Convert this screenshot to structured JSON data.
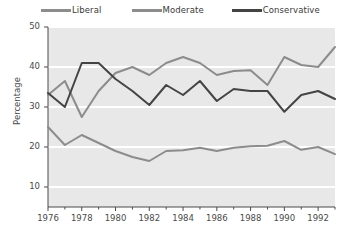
{
  "legend": {
    "position": "top",
    "items": [
      {
        "label": "Liberal",
        "color": "#8c8c8c"
      },
      {
        "label": "Moderate",
        "color": "#8c8c8c"
      },
      {
        "label": "Conservative",
        "color": "#444444"
      }
    ]
  },
  "axes": {
    "ylabel": "Percentage",
    "yticks": [
      "10",
      "20",
      "30",
      "40",
      "50"
    ],
    "xticks": [
      "1976",
      "1978",
      "1980",
      "1982",
      "1984",
      "1986",
      "1988",
      "1990",
      "1992"
    ]
  },
  "colors": {
    "plot_background": "#e8e8e8",
    "gridline": "#ffffff",
    "axis": "#4a4a4a",
    "tick_text": "#4a4a4a"
  },
  "chart_data": {
    "type": "line",
    "title": "",
    "xlabel": "",
    "ylabel": "Percentage",
    "xlim": [
      1976,
      1993
    ],
    "ylim": [
      5,
      50
    ],
    "grid": true,
    "x": [
      1976,
      1977,
      1978,
      1979,
      1980,
      1981,
      1982,
      1983,
      1984,
      1985,
      1986,
      1987,
      1988,
      1989,
      1990,
      1991,
      1992,
      1993
    ],
    "series": [
      {
        "name": "Liberal",
        "color": "#8c8c8c",
        "values": [
          25.0,
          20.5,
          23.0,
          21.0,
          19.0,
          17.5,
          16.5,
          19.0,
          19.2,
          19.8,
          19.0,
          19.8,
          20.2,
          20.3,
          21.5,
          19.3,
          20.0,
          18.2
        ]
      },
      {
        "name": "Moderate",
        "color": "#8c8c8c",
        "values": [
          33.0,
          36.5,
          27.5,
          34.0,
          38.5,
          40.0,
          38.0,
          41.0,
          42.5,
          41.0,
          38.0,
          39.0,
          39.2,
          35.5,
          42.5,
          40.5,
          40.0,
          45.0
        ]
      },
      {
        "name": "Conservative",
        "color": "#444444",
        "values": [
          33.5,
          30.0,
          41.0,
          41.0,
          37.0,
          34.0,
          30.5,
          35.5,
          33.0,
          36.5,
          31.5,
          34.5,
          34.0,
          34.0,
          28.8,
          33.0,
          34.0,
          32.0
        ]
      }
    ]
  }
}
